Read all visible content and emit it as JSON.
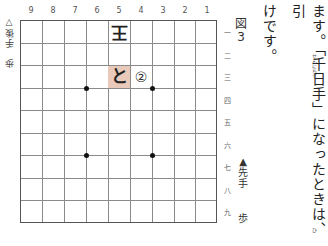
{
  "figure": {
    "label": "図3",
    "label_chars": [
      "図",
      "3"
    ]
  },
  "board": {
    "columns": [
      "9",
      "8",
      "7",
      "6",
      "5",
      "4",
      "3",
      "2",
      "1"
    ],
    "rows": [
      "一",
      "二",
      "三",
      "四",
      "五",
      "六",
      "七",
      "八",
      "九"
    ],
    "highlight_color": "#e9c9b9",
    "pieces": [
      {
        "col": "5",
        "row": "一",
        "char": "王",
        "owner": "gote"
      },
      {
        "col": "5",
        "row": "三",
        "char": "と",
        "owner": "sente",
        "highlight": true
      }
    ],
    "markers": [
      {
        "col": "4",
        "row": "三",
        "char": "②"
      }
    ],
    "star_points": [
      "6-3/4",
      "3-3/4",
      "6-6/7",
      "3-6/7"
    ]
  },
  "players": {
    "sente": {
      "label": "▲先手",
      "label_chars": [
        "▲",
        "先",
        "手"
      ],
      "hand": "歩"
    },
    "gote": {
      "label": "▽後手",
      "label_chars": [
        "歩",
        " ",
        "▽",
        "後",
        "手"
      ],
      "hand": "歩"
    }
  },
  "text": {
    "line1": "ます。「千日手」になったときは、引",
    "line2": "けです。",
    "ruby_sennichite": "せんにちて",
    "ruby_hiki": "ひ"
  }
}
